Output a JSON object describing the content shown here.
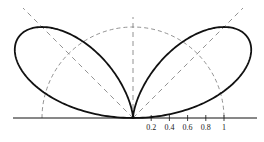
{
  "chart_data": {
    "type": "polar-line",
    "title": "",
    "radial_axis": {
      "tick_labels": [
        "0.2",
        "0.4",
        "0.6",
        "0.8",
        "1"
      ],
      "tick_values": [
        0.2,
        0.4,
        0.6,
        0.8,
        1.0
      ]
    },
    "reference_circle_radius": 1.0,
    "guide_lines_deg": [
      45,
      90,
      135
    ],
    "series": [
      {
        "name": "pattern",
        "formula": "r = 4 sin(phi) cos^2(phi)",
        "max_r": 1.54,
        "max_at_deg": [
          35.3,
          144.7
        ],
        "r_at_45deg": 1.41
      }
    ],
    "colors": {
      "curve": "#111111",
      "guides": "#666666",
      "axis": "#111111"
    }
  }
}
